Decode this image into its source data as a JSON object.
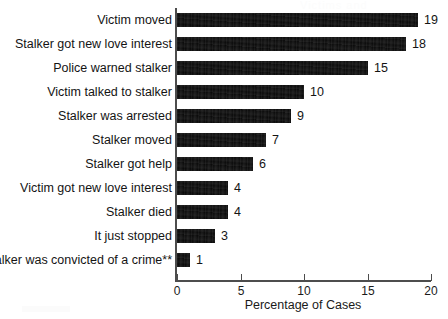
{
  "figure": {
    "ghost_text": "Victims and",
    "background_color": "#ffffff",
    "bar_color": "#0a0a0a",
    "axis_color": "#4d4d4d",
    "text_color": "#141414"
  },
  "chart_data": {
    "type": "bar",
    "orientation": "horizontal",
    "title": "",
    "subtitle": "",
    "xlabel": "Percentage of Cases",
    "ylabel": "",
    "xlim": [
      0,
      20
    ],
    "xticks": [
      0,
      5,
      10,
      15,
      20
    ],
    "xtick_labels": [
      "0",
      "5",
      "10",
      "15",
      "20"
    ],
    "grid": false,
    "legend": null,
    "categories": [
      "Victim moved",
      "Stalker got new love interest",
      "Police warned stalker",
      "Victim talked to stalker",
      "Stalker was arrested",
      "Stalker moved",
      "Stalker got help",
      "Victim got new love interest",
      "Stalker died",
      "It just stopped",
      "Stalker was convicted of a crime**"
    ],
    "values": [
      19,
      18,
      15,
      10,
      9,
      7,
      6,
      4,
      4,
      3,
      1
    ],
    "value_labels": [
      "19",
      "18",
      "15",
      "10",
      "9",
      "7",
      "6",
      "4",
      "4",
      "3",
      "1"
    ],
    "annotations": [
      "**"
    ]
  }
}
